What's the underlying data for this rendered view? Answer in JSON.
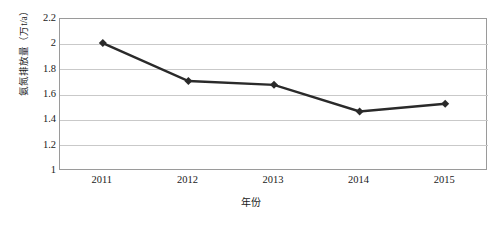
{
  "chart_data": {
    "type": "line",
    "title": "",
    "subtitle": "",
    "xlabel": "年份",
    "ylabel": "氨氮排放量（万t/a）",
    "categories": [
      "2011",
      "2012",
      "2013",
      "2014",
      "2015"
    ],
    "series": [
      {
        "name": "氨氮排放量",
        "values": [
          2.01,
          1.71,
          1.68,
          1.47,
          1.53
        ],
        "color": "#2a2a2a",
        "marker": "diamond",
        "line_width": 2.5
      }
    ],
    "ylim": [
      1,
      2.2
    ],
    "yticks": [
      1,
      1.2,
      1.4,
      1.6,
      1.8,
      2,
      2.2
    ],
    "ytick_labels": [
      "1",
      "1.2",
      "1.4",
      "1.6",
      "1.8",
      "2",
      "2.2"
    ],
    "xtick_labels": [
      "2011",
      "2012",
      "2013",
      "2014",
      "2015"
    ],
    "grid": {
      "horizontal": true,
      "vertical": false,
      "color": "#c9c9c9"
    },
    "legend": {
      "visible": false,
      "position": "none"
    },
    "plot_border_color": "#9a9a9a",
    "background_color": "#ffffff"
  }
}
